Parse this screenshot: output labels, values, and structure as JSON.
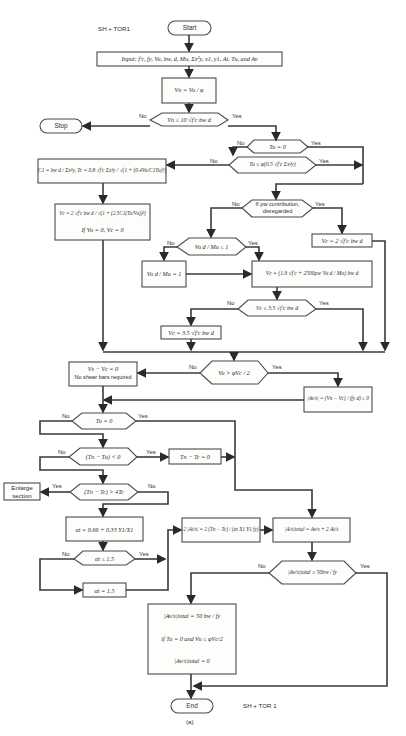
{
  "header": {
    "program_label_top": "SH + TOR1",
    "program_label_bottom": "SH + TOR 1",
    "caption": "(a)"
  },
  "terminals": {
    "start": "Start",
    "stop": "Stop",
    "end": "End",
    "enlarge_section": "Enlarge section"
  },
  "process": {
    "input": "Input:  f'c, fy, Vu, bw, d, Mu, Σx²y, x1, y1, At, Tu, and Av",
    "vn": "Vn = Vu / φ",
    "c1_tc": "C1 = bw d / Σx²y,  Tc = 0.8 √f'c Σx²y / √(1 + (0.4Vu/C1Tu)²)",
    "vc_torsion": "Vc = 2 √f'c bw d / √(1 + (2.5C1(Tu/Vu))²)",
    "vc_torsion_note": "If Vu = 0, Vc = 0",
    "vc_simple": "Vc = 2 √f'c bw d",
    "ratio_one": "Vu d / Mu = 1",
    "vc_detailed": "Vc = (1.9 √f'c + 2500ρw Vu d / Mu) bw d",
    "vc_cap": "Vc = 3.5 √f'c bw d",
    "no_shear": "Vs − Vc = 0",
    "no_shear_note": "No shear bars required",
    "av_s": "|Av/s| = (Vn − Vc) / (fy d) ≥ 0",
    "tn_tc_zero": "Tn − Tc = 0",
    "alpha_t": "αt = 0.66 + 0.33 Y1/X1",
    "alpha_cap": "αt = 1.5",
    "at_s": "2 |At/s| = 2 (Tn − Tc) / (αt X1 Y1 fy)",
    "total": "|A/s|total = Av/s + 2 At/s",
    "min_total": "|Av/s|total = 50 bw / fy",
    "min_total_cond": "if Tu = 0 and Vu ≤ φVc/2",
    "zero_total": "|Av/s|total = 0"
  },
  "decisions": {
    "d1": "Vn ≤ 10 √f'c bw d",
    "d2": "Tu = 0",
    "d3": "Tu ≤ φ(0.5 √f'c Σx²y)",
    "d4": "If ρw contribution, disregarded",
    "d5": "Vu d / Mu ≤ 1",
    "d6": "Vc ≤ 3.5 √f'c bw d",
    "d7": "Vu > φVc / 2",
    "d8": "Tu = 0",
    "d9": "(Tn − Tu) < 0",
    "d10": "(Tn − Tc) > 4Tc",
    "d11": "αt ≤ 1.5",
    "d12": "|Av/s|total ≥ 50bw / fy"
  },
  "branch_labels": {
    "yes": "Yes",
    "no": "No"
  }
}
